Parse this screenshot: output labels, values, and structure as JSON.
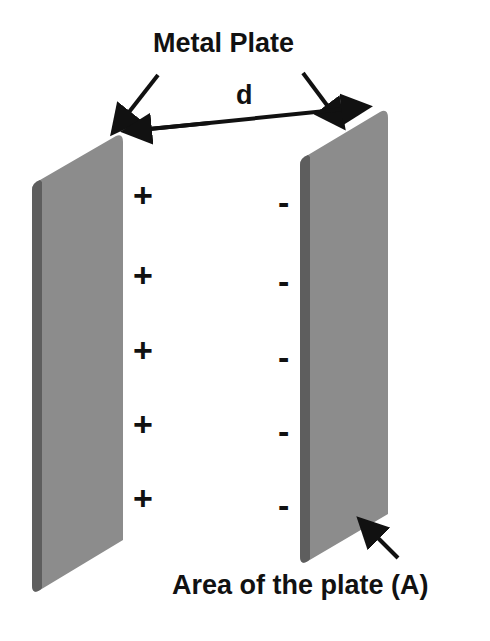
{
  "labels": {
    "metal_plate": "Metal Plate",
    "distance": "d",
    "area": "Area of the plate (A)"
  },
  "charges": {
    "positive": [
      "+",
      "+",
      "+",
      "+",
      "+"
    ],
    "negative": [
      "-",
      "-",
      "-",
      "-",
      "-"
    ]
  },
  "colors": {
    "plate": "#8c8c8c",
    "plate_edge": "#5e5e5e",
    "ink": "#111111"
  }
}
